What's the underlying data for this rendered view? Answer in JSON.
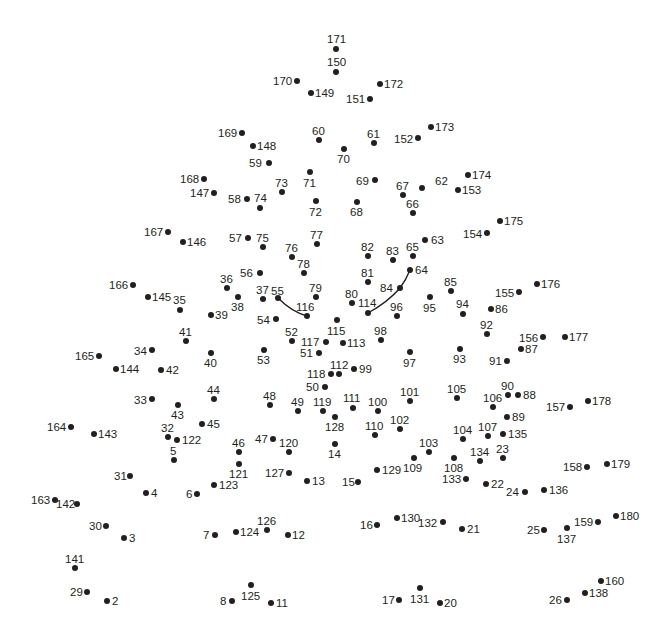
{
  "puzzle": {
    "type": "connect-the-dots",
    "dot_color": "#231f20",
    "curves": [
      {
        "name": "left-eye-curve",
        "d": "M278,298 Q292,312 307,316"
      },
      {
        "name": "right-eye-curve",
        "d": "M368,313 Q388,302 400,288 Q406,280 410,270"
      }
    ],
    "points": [
      {
        "n": "171",
        "x": 336,
        "y": 49,
        "lx": 327,
        "ly": 33
      },
      {
        "n": "150",
        "x": 336,
        "y": 72,
        "lx": 327,
        "ly": 56
      },
      {
        "n": "170",
        "x": 297,
        "y": 81,
        "lx": 273,
        "ly": 75
      },
      {
        "n": "149",
        "x": 311,
        "y": 93,
        "lx": 315,
        "ly": 87
      },
      {
        "n": "172",
        "x": 380,
        "y": 84,
        "lx": 384,
        "ly": 78
      },
      {
        "n": "151",
        "x": 370,
        "y": 99,
        "lx": 346,
        "ly": 93
      },
      {
        "n": "169",
        "x": 242,
        "y": 133,
        "lx": 218,
        "ly": 127
      },
      {
        "n": "148",
        "x": 253,
        "y": 146,
        "lx": 257,
        "ly": 140
      },
      {
        "n": "60",
        "x": 319,
        "y": 140,
        "lx": 312,
        "ly": 125
      },
      {
        "n": "70",
        "x": 344,
        "y": 149,
        "lx": 337,
        "ly": 153
      },
      {
        "n": "61",
        "x": 374,
        "y": 143,
        "lx": 367,
        "ly": 128
      },
      {
        "n": "152",
        "x": 418,
        "y": 138,
        "lx": 394,
        "ly": 133
      },
      {
        "n": "173",
        "x": 431,
        "y": 127,
        "lx": 435,
        "ly": 121
      },
      {
        "n": "59",
        "x": 269,
        "y": 163,
        "lx": 249,
        "ly": 157
      },
      {
        "n": "71",
        "x": 310,
        "y": 172,
        "lx": 303,
        "ly": 177
      },
      {
        "n": "73",
        "x": 282,
        "y": 192,
        "lx": 275,
        "ly": 177
      },
      {
        "n": "168",
        "x": 204,
        "y": 179,
        "lx": 180,
        "ly": 173
      },
      {
        "n": "147",
        "x": 214,
        "y": 193,
        "lx": 190,
        "ly": 187
      },
      {
        "n": "58",
        "x": 247,
        "y": 199,
        "lx": 228,
        "ly": 193
      },
      {
        "n": "74",
        "x": 260,
        "y": 208,
        "lx": 254,
        "ly": 192
      },
      {
        "n": "72",
        "x": 316,
        "y": 201,
        "lx": 309,
        "ly": 206
      },
      {
        "n": "69",
        "x": 375,
        "y": 180,
        "lx": 356,
        "ly": 175
      },
      {
        "n": "68",
        "x": 357,
        "y": 202,
        "lx": 350,
        "ly": 206
      },
      {
        "n": "67",
        "x": 403,
        "y": 195,
        "lx": 396,
        "ly": 180
      },
      {
        "n": "62",
        "x": 422,
        "y": 188,
        "lx": 435,
        "ly": 175
      },
      {
        "n": "66",
        "x": 413,
        "y": 213,
        "lx": 406,
        "ly": 198
      },
      {
        "n": "174",
        "x": 468,
        "y": 175,
        "lx": 472,
        "ly": 169
      },
      {
        "n": "153",
        "x": 458,
        "y": 190,
        "lx": 462,
        "ly": 184
      },
      {
        "n": "167",
        "x": 168,
        "y": 232,
        "lx": 144,
        "ly": 226
      },
      {
        "n": "146",
        "x": 183,
        "y": 242,
        "lx": 187,
        "ly": 236
      },
      {
        "n": "57",
        "x": 248,
        "y": 238,
        "lx": 229,
        "ly": 232
      },
      {
        "n": "75",
        "x": 263,
        "y": 247,
        "lx": 256,
        "ly": 232
      },
      {
        "n": "77",
        "x": 317,
        "y": 244,
        "lx": 310,
        "ly": 229
      },
      {
        "n": "76",
        "x": 292,
        "y": 257,
        "lx": 285,
        "ly": 242
      },
      {
        "n": "78",
        "x": 304,
        "y": 273,
        "lx": 297,
        "ly": 258
      },
      {
        "n": "56",
        "x": 260,
        "y": 273,
        "lx": 240,
        "ly": 267
      },
      {
        "n": "36",
        "x": 227,
        "y": 288,
        "lx": 220,
        "ly": 273
      },
      {
        "n": "38",
        "x": 238,
        "y": 297,
        "lx": 231,
        "ly": 301
      },
      {
        "n": "37",
        "x": 263,
        "y": 299,
        "lx": 256,
        "ly": 284
      },
      {
        "n": "55",
        "x": 278,
        "y": 298,
        "lx": 271,
        "ly": 285
      },
      {
        "n": "79",
        "x": 316,
        "y": 297,
        "lx": 309,
        "ly": 282
      },
      {
        "n": "116",
        "x": 307,
        "y": 316,
        "lx": 296,
        "ly": 301
      },
      {
        "n": "54",
        "x": 276,
        "y": 319,
        "lx": 257,
        "ly": 314
      },
      {
        "n": "166",
        "x": 133,
        "y": 285,
        "lx": 109,
        "ly": 279
      },
      {
        "n": "145",
        "x": 148,
        "y": 297,
        "lx": 152,
        "ly": 291
      },
      {
        "n": "35",
        "x": 180,
        "y": 310,
        "lx": 173,
        "ly": 294
      },
      {
        "n": "39",
        "x": 211,
        "y": 315,
        "lx": 215,
        "ly": 309
      },
      {
        "n": "82",
        "x": 368,
        "y": 256,
        "lx": 361,
        "ly": 241
      },
      {
        "n": "83",
        "x": 393,
        "y": 260,
        "lx": 386,
        "ly": 245
      },
      {
        "n": "65",
        "x": 413,
        "y": 256,
        "lx": 406,
        "ly": 241
      },
      {
        "n": "63",
        "x": 425,
        "y": 240,
        "lx": 431,
        "ly": 234
      },
      {
        "n": "64",
        "x": 410,
        "y": 270,
        "lx": 415,
        "ly": 264
      },
      {
        "n": "81",
        "x": 368,
        "y": 282,
        "lx": 361,
        "ly": 267
      },
      {
        "n": "84",
        "x": 400,
        "y": 288,
        "lx": 380,
        "ly": 282
      },
      {
        "n": "80",
        "x": 352,
        "y": 303,
        "lx": 345,
        "ly": 288
      },
      {
        "n": "114",
        "x": 368,
        "y": 313,
        "lx": 358,
        "ly": 297
      },
      {
        "n": "96",
        "x": 397,
        "y": 316,
        "lx": 390,
        "ly": 301
      },
      {
        "n": "95",
        "x": 430,
        "y": 297,
        "lx": 423,
        "ly": 302
      },
      {
        "n": "85",
        "x": 451,
        "y": 291,
        "lx": 444,
        "ly": 276
      },
      {
        "n": "94",
        "x": 463,
        "y": 314,
        "lx": 456,
        "ly": 298
      },
      {
        "n": "154",
        "x": 487,
        "y": 233,
        "lx": 463,
        "ly": 228
      },
      {
        "n": "175",
        "x": 500,
        "y": 221,
        "lx": 504,
        "ly": 215
      },
      {
        "n": "155",
        "x": 519,
        "y": 292,
        "lx": 495,
        "ly": 287
      },
      {
        "n": "176",
        "x": 537,
        "y": 284,
        "lx": 541,
        "ly": 278
      },
      {
        "n": "86",
        "x": 491,
        "y": 309,
        "lx": 495,
        "ly": 303
      },
      {
        "n": "92",
        "x": 487,
        "y": 334,
        "lx": 480,
        "ly": 319
      },
      {
        "n": "156",
        "x": 543,
        "y": 337,
        "lx": 519,
        "ly": 332
      },
      {
        "n": "177",
        "x": 565,
        "y": 337,
        "lx": 569,
        "ly": 331
      },
      {
        "n": "87",
        "x": 521,
        "y": 349,
        "lx": 525,
        "ly": 343
      },
      {
        "n": "91",
        "x": 507,
        "y": 361,
        "lx": 489,
        "ly": 355
      },
      {
        "n": "93",
        "x": 460,
        "y": 349,
        "lx": 453,
        "ly": 353
      },
      {
        "n": "97",
        "x": 410,
        "y": 352,
        "lx": 403,
        "ly": 357
      },
      {
        "n": "98",
        "x": 381,
        "y": 340,
        "lx": 374,
        "ly": 325
      },
      {
        "n": "115",
        "x": 337,
        "y": 320,
        "lx": 327,
        "ly": 325
      },
      {
        "n": "113",
        "x": 343,
        "y": 343,
        "lx": 347,
        "ly": 337
      },
      {
        "n": "52",
        "x": 292,
        "y": 341,
        "lx": 285,
        "ly": 326
      },
      {
        "n": "117",
        "x": 326,
        "y": 342,
        "lx": 301,
        "ly": 336
      },
      {
        "n": "51",
        "x": 319,
        "y": 353,
        "lx": 300,
        "ly": 347
      },
      {
        "n": "53",
        "x": 264,
        "y": 350,
        "lx": 257,
        "ly": 354
      },
      {
        "n": "41",
        "x": 186,
        "y": 341,
        "lx": 179,
        "ly": 326
      },
      {
        "n": "40",
        "x": 211,
        "y": 353,
        "lx": 204,
        "ly": 357
      },
      {
        "n": "34",
        "x": 152,
        "y": 350,
        "lx": 134,
        "ly": 345
      },
      {
        "n": "165",
        "x": 99,
        "y": 356,
        "lx": 75,
        "ly": 350
      },
      {
        "n": "144",
        "x": 116,
        "y": 369,
        "lx": 120,
        "ly": 363
      },
      {
        "n": "42",
        "x": 161,
        "y": 370,
        "lx": 166,
        "ly": 364
      },
      {
        "n": "112",
        "x": 339,
        "y": 374,
        "lx": 330,
        "ly": 359
      },
      {
        "n": "118",
        "x": 331,
        "y": 374,
        "lx": 307,
        "ly": 368
      },
      {
        "n": "99",
        "x": 354,
        "y": 369,
        "lx": 359,
        "ly": 363
      },
      {
        "n": "50",
        "x": 325,
        "y": 387,
        "lx": 306,
        "ly": 381
      },
      {
        "n": "48",
        "x": 270,
        "y": 405,
        "lx": 263,
        "ly": 390
      },
      {
        "n": "49",
        "x": 298,
        "y": 411,
        "lx": 291,
        "ly": 396
      },
      {
        "n": "119",
        "x": 323,
        "y": 411,
        "lx": 313,
        "ly": 396
      },
      {
        "n": "111",
        "x": 353,
        "y": 408,
        "lx": 343,
        "ly": 392
      },
      {
        "n": "100",
        "x": 378,
        "y": 411,
        "lx": 368,
        "ly": 396
      },
      {
        "n": "101",
        "x": 410,
        "y": 401,
        "lx": 400,
        "ly": 386
      },
      {
        "n": "128",
        "x": 335,
        "y": 417,
        "lx": 325,
        "ly": 421
      },
      {
        "n": "110",
        "x": 375,
        "y": 435,
        "lx": 365,
        "ly": 420
      },
      {
        "n": "102",
        "x": 400,
        "y": 429,
        "lx": 390,
        "ly": 414
      },
      {
        "n": "14",
        "x": 335,
        "y": 444,
        "lx": 328,
        "ly": 448
      },
      {
        "n": "105",
        "x": 457,
        "y": 398,
        "lx": 447,
        "ly": 383
      },
      {
        "n": "106",
        "x": 493,
        "y": 407,
        "lx": 483,
        "ly": 392
      },
      {
        "n": "90",
        "x": 508,
        "y": 395,
        "lx": 501,
        "ly": 380
      },
      {
        "n": "88",
        "x": 518,
        "y": 395,
        "lx": 523,
        "ly": 389
      },
      {
        "n": "89",
        "x": 507,
        "y": 417,
        "lx": 512,
        "ly": 411
      },
      {
        "n": "157",
        "x": 570,
        "y": 407,
        "lx": 546,
        "ly": 401
      },
      {
        "n": "178",
        "x": 588,
        "y": 401,
        "lx": 592,
        "ly": 395
      },
      {
        "n": "104",
        "x": 463,
        "y": 439,
        "lx": 453,
        "ly": 424
      },
      {
        "n": "107",
        "x": 488,
        "y": 436,
        "lx": 478,
        "ly": 421
      },
      {
        "n": "135",
        "x": 503,
        "y": 434,
        "lx": 508,
        "ly": 428
      },
      {
        "n": "103",
        "x": 429,
        "y": 452,
        "lx": 419,
        "ly": 437
      },
      {
        "n": "109",
        "x": 414,
        "y": 458,
        "lx": 403,
        "ly": 462
      },
      {
        "n": "108",
        "x": 454,
        "y": 458,
        "lx": 444,
        "ly": 462
      },
      {
        "n": "134",
        "x": 480,
        "y": 461,
        "lx": 470,
        "ly": 446
      },
      {
        "n": "23",
        "x": 503,
        "y": 458,
        "lx": 496,
        "ly": 443
      },
      {
        "n": "133",
        "x": 466,
        "y": 479,
        "lx": 442,
        "ly": 473
      },
      {
        "n": "22",
        "x": 486,
        "y": 484,
        "lx": 491,
        "ly": 478
      },
      {
        "n": "24",
        "x": 525,
        "y": 492,
        "lx": 506,
        "ly": 486
      },
      {
        "n": "136",
        "x": 544,
        "y": 490,
        "lx": 549,
        "ly": 484
      },
      {
        "n": "158",
        "x": 587,
        "y": 467,
        "lx": 563,
        "ly": 461
      },
      {
        "n": "179",
        "x": 607,
        "y": 464,
        "lx": 611,
        "ly": 458
      },
      {
        "n": "129",
        "x": 377,
        "y": 470,
        "lx": 382,
        "ly": 464
      },
      {
        "n": "15",
        "x": 358,
        "y": 482,
        "lx": 342,
        "ly": 476
      },
      {
        "n": "13",
        "x": 307,
        "y": 481,
        "lx": 312,
        "ly": 475
      },
      {
        "n": "127",
        "x": 289,
        "y": 473,
        "lx": 265,
        "ly": 467
      },
      {
        "n": "47",
        "x": 273,
        "y": 439,
        "lx": 255,
        "ly": 433
      },
      {
        "n": "120",
        "x": 289,
        "y": 452,
        "lx": 279,
        "ly": 437
      },
      {
        "n": "46",
        "x": 239,
        "y": 452,
        "lx": 232,
        "ly": 437
      },
      {
        "n": "121",
        "x": 239,
        "y": 464,
        "lx": 229,
        "ly": 468
      },
      {
        "n": "123",
        "x": 214,
        "y": 485,
        "lx": 219,
        "ly": 479
      },
      {
        "n": "6",
        "x": 197,
        "y": 494,
        "lx": 186,
        "ly": 488
      },
      {
        "n": "44",
        "x": 214,
        "y": 399,
        "lx": 207,
        "ly": 384
      },
      {
        "n": "45",
        "x": 202,
        "y": 424,
        "lx": 207,
        "ly": 418
      },
      {
        "n": "43",
        "x": 178,
        "y": 405,
        "lx": 171,
        "ly": 409
      },
      {
        "n": "33",
        "x": 152,
        "y": 399,
        "lx": 134,
        "ly": 394
      },
      {
        "n": "32",
        "x": 168,
        "y": 437,
        "lx": 161,
        "ly": 422
      },
      {
        "n": "122",
        "x": 177,
        "y": 440,
        "lx": 182,
        "ly": 434
      },
      {
        "n": "5",
        "x": 174,
        "y": 460,
        "lx": 170,
        "ly": 445
      },
      {
        "n": "164",
        "x": 71,
        "y": 427,
        "lx": 47,
        "ly": 421
      },
      {
        "n": "143",
        "x": 94,
        "y": 434,
        "lx": 98,
        "ly": 428
      },
      {
        "n": "31",
        "x": 130,
        "y": 476,
        "lx": 114,
        "ly": 470
      },
      {
        "n": "4",
        "x": 146,
        "y": 493,
        "lx": 151,
        "ly": 487
      },
      {
        "n": "163",
        "x": 55,
        "y": 500,
        "lx": 31,
        "ly": 494
      },
      {
        "n": "142",
        "x": 77,
        "y": 504,
        "lx": 56,
        "ly": 498
      },
      {
        "n": "30",
        "x": 106,
        "y": 526,
        "lx": 89,
        "ly": 520
      },
      {
        "n": "3",
        "x": 124,
        "y": 538,
        "lx": 129,
        "ly": 532
      },
      {
        "n": "141",
        "x": 75,
        "y": 568,
        "lx": 65,
        "ly": 553
      },
      {
        "n": "29",
        "x": 87,
        "y": 592,
        "lx": 70,
        "ly": 586
      },
      {
        "n": "2",
        "x": 107,
        "y": 601,
        "lx": 112,
        "ly": 595
      },
      {
        "n": "7",
        "x": 215,
        "y": 535,
        "lx": 203,
        "ly": 529
      },
      {
        "n": "124",
        "x": 236,
        "y": 532,
        "lx": 240,
        "ly": 526
      },
      {
        "n": "126",
        "x": 267,
        "y": 530,
        "lx": 257,
        "ly": 515
      },
      {
        "n": "12",
        "x": 288,
        "y": 535,
        "lx": 292,
        "ly": 529
      },
      {
        "n": "8",
        "x": 232,
        "y": 601,
        "lx": 220,
        "ly": 595
      },
      {
        "n": "125",
        "x": 251,
        "y": 585,
        "lx": 241,
        "ly": 590
      },
      {
        "n": "11",
        "x": 271,
        "y": 603,
        "lx": 276,
        "ly": 597
      },
      {
        "n": "16",
        "x": 377,
        "y": 525,
        "lx": 360,
        "ly": 519
      },
      {
        "n": "130",
        "x": 397,
        "y": 518,
        "lx": 401,
        "ly": 512
      },
      {
        "n": "132",
        "x": 443,
        "y": 522,
        "lx": 418,
        "ly": 517
      },
      {
        "n": "21",
        "x": 462,
        "y": 529,
        "lx": 467,
        "ly": 523
      },
      {
        "n": "25",
        "x": 544,
        "y": 530,
        "lx": 527,
        "ly": 524
      },
      {
        "n": "137",
        "x": 567,
        "y": 528,
        "lx": 557,
        "ly": 533
      },
      {
        "n": "159",
        "x": 598,
        "y": 522,
        "lx": 574,
        "ly": 516
      },
      {
        "n": "180",
        "x": 616,
        "y": 516,
        "lx": 620,
        "ly": 510
      },
      {
        "n": "17",
        "x": 399,
        "y": 600,
        "lx": 382,
        "ly": 594
      },
      {
        "n": "131",
        "x": 420,
        "y": 588,
        "lx": 410,
        "ly": 593
      },
      {
        "n": "20",
        "x": 440,
        "y": 603,
        "lx": 444,
        "ly": 597
      },
      {
        "n": "26",
        "x": 567,
        "y": 600,
        "lx": 549,
        "ly": 594
      },
      {
        "n": "138",
        "x": 585,
        "y": 593,
        "lx": 589,
        "ly": 587
      },
      {
        "n": "160",
        "x": 601,
        "y": 581,
        "lx": 605,
        "ly": 575
      }
    ]
  }
}
